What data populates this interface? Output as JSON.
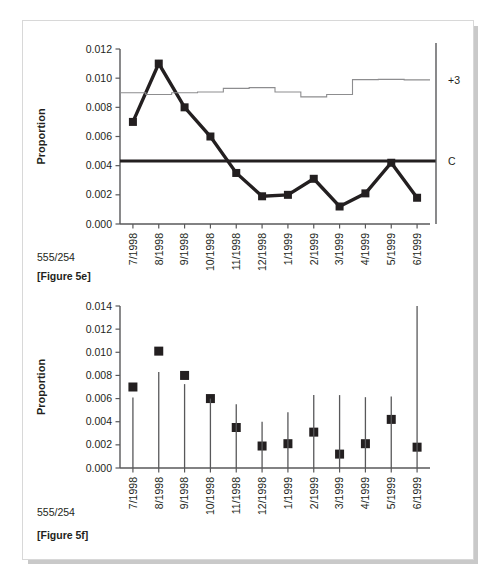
{
  "page": {
    "background": "#ffffff",
    "sheet_color": "#ffffff",
    "shadow_color": "#c9c9c9"
  },
  "colors": {
    "ink": "#231f20",
    "axis": "#58585a",
    "ucl": "#8d8d8f",
    "marker": "#231f20"
  },
  "figure_e": {
    "ratio_label": "555/254",
    "caption": "[Figure 5e]",
    "right_labels": {
      "ucl": "+3",
      "center": "C"
    },
    "ylabel": "Proportion"
  },
  "figure_f": {
    "ratio_label": "555/254",
    "caption": "[Figure 5f]",
    "ylabel": "Proportion"
  },
  "chart_data": [
    {
      "id": "figure-5e",
      "type": "line",
      "title": "[Figure 5e]",
      "xlabel": "",
      "ylabel": "Proportion",
      "ylim": [
        0.0,
        0.012
      ],
      "yticks": [
        "0.000",
        "0.002",
        "0.004",
        "0.006",
        "0.008",
        "0.010",
        "0.012"
      ],
      "ytick_values": [
        0.0,
        0.002,
        0.004,
        0.006,
        0.008,
        0.01,
        0.012
      ],
      "grid": false,
      "legend": "none",
      "annotations": [
        {
          "text": "+3",
          "position": "right-axis",
          "y": 0.0099
        },
        {
          "text": "C",
          "position": "right-axis",
          "y": 0.00432
        },
        {
          "text": "555/254",
          "position": "below-left-of-xticks"
        }
      ],
      "categories": [
        "7/1998",
        "8/1998",
        "9/1998",
        "10/1998",
        "11/1998",
        "12/1998",
        "1/1999",
        "2/1999",
        "3/1999",
        "4/1999",
        "5/1999",
        "6/1999"
      ],
      "series": [
        {
          "name": "Proportion",
          "style": "line+square-markers",
          "values": [
            0.007,
            0.011,
            0.008,
            0.006,
            0.0035,
            0.0019,
            0.002,
            0.0031,
            0.0012,
            0.0021,
            0.0042,
            0.0018
          ]
        },
        {
          "name": "Upper control limit (+3 sigma)",
          "style": "step",
          "values": [
            0.009,
            0.00888,
            0.009,
            0.00905,
            0.0093,
            0.00935,
            0.00905,
            0.00872,
            0.00888,
            0.0099,
            0.00992,
            0.00988
          ]
        },
        {
          "name": "Center line (C)",
          "style": "constant",
          "value": 0.00432
        }
      ]
    },
    {
      "id": "figure-5f",
      "type": "scatter",
      "title": "[Figure 5f]",
      "xlabel": "",
      "ylabel": "Proportion",
      "ylim": [
        0.0,
        0.014
      ],
      "yticks": [
        "0.000",
        "0.002",
        "0.004",
        "0.006",
        "0.008",
        "0.010",
        "0.012",
        "0.014"
      ],
      "ytick_values": [
        0.0,
        0.002,
        0.004,
        0.006,
        0.008,
        0.01,
        0.012,
        0.014
      ],
      "grid": false,
      "legend": "none",
      "annotations": [
        {
          "text": "555/254",
          "position": "below-left-of-xticks"
        }
      ],
      "categories": [
        "7/1998",
        "8/1998",
        "9/1998",
        "10/1998",
        "11/1998",
        "12/1998",
        "1/1999",
        "2/1999",
        "3/1999",
        "4/1999",
        "5/1999",
        "6/1999"
      ],
      "series": [
        {
          "name": "Proportion",
          "style": "square-markers",
          "values": [
            0.007,
            0.0101,
            0.008,
            0.006,
            0.0035,
            0.0019,
            0.0021,
            0.0031,
            0.0012,
            0.0021,
            0.0042,
            0.0018
          ]
        },
        {
          "name": "Upper limit (whisker top)",
          "style": "vertical-line-top",
          "values": [
            0.0061,
            0.0083,
            0.00725,
            0.006,
            0.0055,
            0.004,
            0.00482,
            0.0063,
            0.0063,
            0.00612,
            0.00618,
            0.014
          ]
        }
      ]
    }
  ]
}
